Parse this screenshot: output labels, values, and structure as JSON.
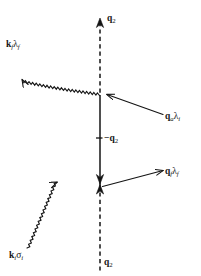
{
  "figure": {
    "type": "feynman-scattering-diagram",
    "background_color": "#ffffff",
    "line_color": "#141414",
    "width": 201,
    "height": 276
  },
  "labels": {
    "axis_top": {
      "symbol": "q",
      "subscript": "2",
      "text": "q2"
    },
    "axis_bottom": {
      "symbol": "q",
      "subscript": "2",
      "text": "q2"
    },
    "axis_middle": {
      "symbol": "−q",
      "subscript": "2",
      "text": "-q2"
    },
    "outgoing_photon": {
      "symbol": "k",
      "subscript": "f",
      "greek": "λ",
      "greek_subscript": "f",
      "text": "kfλf"
    },
    "incoming_photon": {
      "symbol": "k",
      "subscript": "i",
      "greek": "σ",
      "greek_subscript": "i",
      "text": "kiσi"
    },
    "incoming_momentum": {
      "symbol": "q",
      "subscript": "a",
      "greek": "λ",
      "greek_subscript": "i",
      "text": "qaλi"
    },
    "outgoing_momentum": {
      "symbol": "q",
      "subscript": "f",
      "greek": "λ",
      "greek_subscript": "f",
      "text": "qfλf"
    }
  },
  "elements": {
    "vertical_axis": {
      "name": "vertical-propagator-axis",
      "x": 100,
      "top_y": 20,
      "bottom_y": 272,
      "upper_vertex_y": 95,
      "lower_vertex_y": 185,
      "style_above_upper": "dashed",
      "style_between": "solid",
      "style_below_lower": "dashed"
    },
    "upper_vertex": {
      "name": "upper-vertex",
      "x": 100,
      "y": 95
    },
    "lower_vertex": {
      "name": "lower-vertex",
      "x": 100,
      "y": 185
    },
    "outgoing_photon_line": {
      "name": "outgoing-photon-wavy-line",
      "from_x": 100,
      "from_y": 95,
      "to_x": 19,
      "to_y": 44,
      "wavy": true,
      "arrow_at": "end"
    },
    "incoming_photon_line": {
      "name": "incoming-photon-wavy-line",
      "from_x": 27,
      "from_y": 247,
      "to_x": 100,
      "to_y": 185,
      "wavy": true,
      "arrow_at": "end"
    },
    "incoming_momentum_arrow": {
      "name": "incoming-momentum-arrow",
      "from_x": 163,
      "from_y": 114,
      "to_x": 106,
      "to_y": 94,
      "arrow_at": "end"
    },
    "outgoing_momentum_arrow": {
      "name": "outgoing-momentum-arrow",
      "from_x": 103,
      "from_y": 186,
      "to_x": 164,
      "to_y": 170,
      "arrow_at": "end"
    },
    "axis_top_arrowhead": {
      "name": "axis-top-arrowhead",
      "direction": "up"
    },
    "axis_mid_arrowhead": {
      "name": "axis-mid-arrowhead",
      "direction": "down"
    },
    "axis_lower_arrowhead": {
      "name": "axis-lower-arrowhead",
      "direction": "up"
    },
    "middle_tick": {
      "name": "middle-tick-mark",
      "x1": 96,
      "x2": 102,
      "y": 138
    }
  }
}
